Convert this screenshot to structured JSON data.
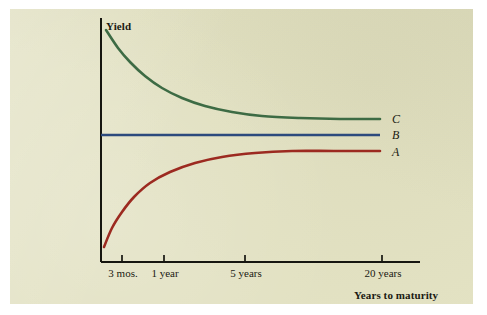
{
  "figure": {
    "panel_background": "#e3e2c3",
    "page_background": "#ffffff",
    "ink_color": "#1a1a12"
  },
  "axes": {
    "y_axis_title": "Yield",
    "x_axis_title": "Years to maturity",
    "x_tick_labels": [
      "3 mos.",
      "1 year",
      "5 years",
      "20 years"
    ],
    "y_tick_labels": [],
    "grid": false
  },
  "series_labels": {
    "upper": "C",
    "middle": "B",
    "lower": "A"
  },
  "colors": {
    "curve_c_green": "#3d6b44",
    "curve_b_blue": "#2c4a7d",
    "curve_a_red": "#9c2a20",
    "axis": "#161610"
  },
  "chart_data": {
    "type": "line",
    "title": "",
    "subtitle": "",
    "xlabel": "Years to maturity",
    "ylabel": "Yield",
    "grid": false,
    "legend_position": "right-inline-end-of-curve",
    "x_tick_labels": [
      "3 mos.",
      "1 year",
      "5 years",
      "20 years"
    ],
    "x_tick_positions_px": [
      122,
      164,
      245,
      382
    ],
    "xlim_px": [
      101,
      420
    ],
    "ylim_px": [
      18,
      262
    ],
    "y_axis_has_numeric_ticks": false,
    "annotations": [
      {
        "text": "C",
        "x_px": 392,
        "y_px": 119,
        "style": "italic"
      },
      {
        "text": "B",
        "x_px": 392,
        "y_px": 135,
        "style": "italic"
      },
      {
        "text": "A",
        "x_px": 392,
        "y_px": 152,
        "style": "italic"
      }
    ],
    "series": [
      {
        "name": "C",
        "description": "downward-sloping (inverted) yield curve, decays asymptotically toward a level above B",
        "color": "#3d6b44",
        "label": "C",
        "x": [
          "3 mos.",
          "1 year",
          "5 years",
          "20 years"
        ],
        "points_px": [
          [
            106,
            30
          ],
          [
            118,
            48
          ],
          [
            130,
            62
          ],
          [
            145,
            76
          ],
          [
            162,
            88
          ],
          [
            182,
            98
          ],
          [
            205,
            106
          ],
          [
            232,
            112
          ],
          [
            262,
            116
          ],
          [
            300,
            118
          ],
          [
            340,
            119
          ],
          [
            380,
            119
          ]
        ]
      },
      {
        "name": "B",
        "description": "flat yield curve, constant yield across all maturities",
        "color": "#2c4a7d",
        "label": "B",
        "x": [
          "3 mos.",
          "1 year",
          "5 years",
          "20 years"
        ],
        "points_px": [
          [
            101,
            135
          ],
          [
            380,
            135
          ]
        ]
      },
      {
        "name": "A",
        "description": "upward-sloping (normal) yield curve, rises steeply then flattens toward a level below B",
        "color": "#9c2a20",
        "label": "A",
        "x": [
          "3 mos.",
          "1 year",
          "5 years",
          "20 years"
        ],
        "points_px": [
          [
            104,
            247
          ],
          [
            112,
            228
          ],
          [
            122,
            212
          ],
          [
            134,
            197
          ],
          [
            150,
            183
          ],
          [
            170,
            172
          ],
          [
            195,
            163
          ],
          [
            222,
            157
          ],
          [
            255,
            153
          ],
          [
            292,
            151
          ],
          [
            334,
            151
          ],
          [
            380,
            151
          ]
        ]
      }
    ]
  }
}
